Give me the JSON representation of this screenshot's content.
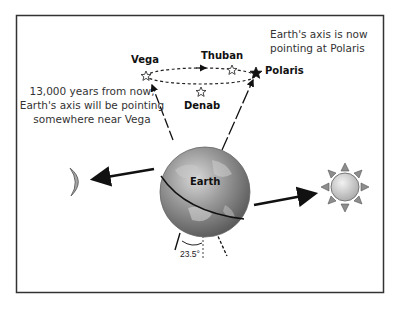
{
  "diagram": {
    "frame": {
      "x": 16,
      "y": 15,
      "width": 368,
      "height": 278,
      "border_color": "#333333"
    },
    "stars": [
      {
        "name": "Vega",
        "x": 148,
        "y": 75,
        "filled": false
      },
      {
        "name": "Thuban",
        "x": 233,
        "y": 69,
        "filled": false
      },
      {
        "name": "Denab",
        "x": 201,
        "y": 92,
        "filled": false
      },
      {
        "name": "Polaris",
        "x": 256,
        "y": 72,
        "filled": true
      }
    ],
    "labels": {
      "vega": "Vega",
      "thuban": "Thuban",
      "denab": "Denab",
      "polaris": "Polaris",
      "earth": "Earth",
      "angle": "23.5°"
    },
    "notes": {
      "future_line1": "13,000 years from now,",
      "future_line2": "Earth's axis will be pointing",
      "future_line3": "somewhere near Vega",
      "current_line1": "Earth's axis is now",
      "current_line2": "pointing at Polaris"
    },
    "bodies": {
      "moon": {
        "name": "Moon",
        "x": 105,
        "y": 181
      },
      "earth": {
        "name": "Earth",
        "cx": 205,
        "cy": 192,
        "r": 45
      },
      "sun": {
        "name": "Sun",
        "cx": 345,
        "cy": 187,
        "r": 15
      }
    },
    "colors": {
      "line": "#111111",
      "earth_fill": "#8f8f8f",
      "sun_fill": "#cfcfcf",
      "moon_fill": "#a0a0a0",
      "text": "#333333"
    }
  }
}
